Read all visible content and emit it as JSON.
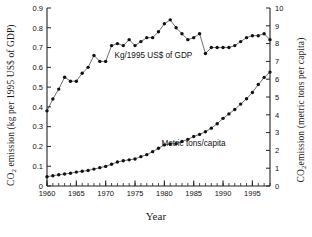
{
  "chart_data": {
    "type": "line",
    "title": "",
    "xlabel": "Year",
    "ylabel_left": "CO2 emission (kg per 1995 US$ of GDP)",
    "ylabel_right": "CO2emission (metric tons per capita)",
    "xlim": [
      1960,
      1998
    ],
    "ylim_left": [
      0,
      0.9
    ],
    "ylim_right": [
      0,
      10
    ],
    "xticks": [
      1960,
      1965,
      1970,
      1975,
      1980,
      1985,
      1990,
      1995
    ],
    "xticklabels": [
      "1960",
      "1965",
      "1970",
      "1975",
      "1980",
      "1985",
      "1990",
      "1995"
    ],
    "yticks_left": [
      0,
      0.1,
      0.2,
      0.3,
      0.4,
      0.5,
      0.6,
      0.7,
      0.8,
      0.9
    ],
    "yticklabels_left": [
      "0",
      "0.1",
      "0.2",
      "0.3",
      "0.4",
      "0.5",
      "0.6",
      "0.7",
      "0.8",
      "0.9"
    ],
    "yticks_right": [
      0,
      1,
      2,
      3,
      4,
      5,
      6,
      7,
      8,
      9,
      10
    ],
    "yticklabels_right": [
      "0",
      "1",
      "2",
      "3",
      "4",
      "5",
      "6",
      "7",
      "8",
      "9",
      "10"
    ],
    "minor_xticks_every": 1,
    "grid": false,
    "legend_position": "inline-annotations",
    "marker": "filled-circle",
    "x": [
      1960,
      1961,
      1962,
      1963,
      1964,
      1965,
      1966,
      1967,
      1968,
      1969,
      1970,
      1971,
      1972,
      1973,
      1974,
      1975,
      1976,
      1977,
      1978,
      1979,
      1980,
      1981,
      1982,
      1983,
      1984,
      1985,
      1986,
      1987,
      1988,
      1989,
      1990,
      1991,
      1992,
      1993,
      1994,
      1995,
      1996,
      1997,
      1998
    ],
    "series": [
      {
        "name": "Kg/1995 US$ of GDP",
        "axis": "left",
        "annotation": "Kg/1995 US$ of GDP",
        "annotation_x": 1971.5,
        "annotation_y": 0.645,
        "values": [
          0.38,
          0.44,
          0.49,
          0.55,
          0.53,
          0.53,
          0.57,
          0.6,
          0.66,
          0.63,
          0.63,
          0.71,
          0.72,
          0.71,
          0.74,
          0.71,
          0.73,
          0.75,
          0.75,
          0.78,
          0.82,
          0.84,
          0.8,
          0.77,
          0.74,
          0.75,
          0.77,
          0.67,
          0.7,
          0.7,
          0.7,
          0.7,
          0.71,
          0.73,
          0.75,
          0.76,
          0.76,
          0.77,
          0.74
        ]
      },
      {
        "name": "Metric tons/capita",
        "axis": "right",
        "annotation": "Metric tons/capita",
        "annotation_x": 1979.5,
        "annotation_y": 2.25,
        "values": [
          0.52,
          0.58,
          0.63,
          0.67,
          0.72,
          0.78,
          0.83,
          0.87,
          0.95,
          1.03,
          1.1,
          1.22,
          1.35,
          1.42,
          1.47,
          1.52,
          1.65,
          1.76,
          1.93,
          2.12,
          2.31,
          2.36,
          2.38,
          2.5,
          2.62,
          2.78,
          2.9,
          3.05,
          3.25,
          3.5,
          3.8,
          4.05,
          4.3,
          4.6,
          4.9,
          5.25,
          5.7,
          6.1,
          6.4
        ]
      }
    ],
    "series_right_tail_left_axis": {
      "note": "upper curve values in right-axis display units",
      "values_right_units": [
        4.2,
        4.9,
        5.4,
        6.1,
        5.9,
        5.9,
        6.3,
        6.6,
        7.3,
        7.0,
        7.0,
        7.9,
        8.0,
        7.9,
        8.2,
        7.9,
        8.1,
        8.3,
        8.3,
        8.7,
        9.1,
        9.3,
        8.9,
        8.6,
        8.2,
        8.3,
        8.6,
        7.4,
        7.8,
        7.8,
        7.8,
        7.8,
        7.9,
        8.1,
        8.3,
        8.4,
        8.4,
        8.5,
        8.2
      ]
    }
  }
}
